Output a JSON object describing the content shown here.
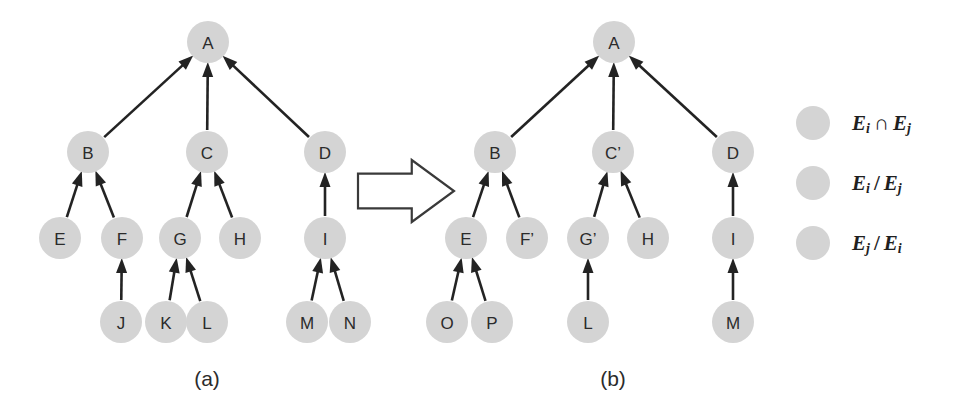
{
  "figure": {
    "background_color": "#ffffff",
    "node_fill_color": "#d4d4d4",
    "edge_color": "#232323",
    "text_color": "#2b2b2b"
  },
  "panels": [
    {
      "key": "a",
      "caption": "(a)",
      "caption_x": 207,
      "caption_y": 378,
      "nodes": [
        {
          "id": "a-A",
          "label": "A",
          "x": 208,
          "y": 42,
          "r": 21
        },
        {
          "id": "a-B",
          "label": "B",
          "x": 88,
          "y": 152,
          "r": 21
        },
        {
          "id": "a-C",
          "label": "C",
          "x": 207,
          "y": 152,
          "r": 21
        },
        {
          "id": "a-D",
          "label": "D",
          "x": 325,
          "y": 152,
          "r": 21
        },
        {
          "id": "a-E",
          "label": "E",
          "x": 60,
          "y": 238,
          "r": 21
        },
        {
          "id": "a-F",
          "label": "F",
          "x": 122,
          "y": 238,
          "r": 21
        },
        {
          "id": "a-G",
          "label": "G",
          "x": 180,
          "y": 238,
          "r": 21
        },
        {
          "id": "a-H",
          "label": "H",
          "x": 240,
          "y": 238,
          "r": 21
        },
        {
          "id": "a-I",
          "label": "I",
          "x": 325,
          "y": 238,
          "r": 21
        },
        {
          "id": "a-J",
          "label": "J",
          "x": 121,
          "y": 322,
          "r": 21
        },
        {
          "id": "a-K",
          "label": "K",
          "x": 166,
          "y": 322,
          "r": 21
        },
        {
          "id": "a-L",
          "label": "L",
          "x": 207,
          "y": 322,
          "r": 21
        },
        {
          "id": "a-M",
          "label": "M",
          "x": 307,
          "y": 322,
          "r": 21
        },
        {
          "id": "a-N",
          "label": "N",
          "x": 350,
          "y": 322,
          "r": 21
        }
      ],
      "edges": [
        {
          "from": "a-B",
          "to": "a-A"
        },
        {
          "from": "a-C",
          "to": "a-A"
        },
        {
          "from": "a-D",
          "to": "a-A"
        },
        {
          "from": "a-E",
          "to": "a-B"
        },
        {
          "from": "a-F",
          "to": "a-B"
        },
        {
          "from": "a-G",
          "to": "a-C"
        },
        {
          "from": "a-H",
          "to": "a-C"
        },
        {
          "from": "a-I",
          "to": "a-D"
        },
        {
          "from": "a-J",
          "to": "a-F"
        },
        {
          "from": "a-K",
          "to": "a-G"
        },
        {
          "from": "a-L",
          "to": "a-G"
        },
        {
          "from": "a-M",
          "to": "a-I"
        },
        {
          "from": "a-N",
          "to": "a-I"
        }
      ]
    },
    {
      "key": "b",
      "caption": "(b)",
      "caption_x": 613,
      "caption_y": 378,
      "nodes": [
        {
          "id": "b-A",
          "label": "A",
          "x": 614,
          "y": 42,
          "r": 21
        },
        {
          "id": "b-B",
          "label": "B",
          "x": 495,
          "y": 152,
          "r": 21
        },
        {
          "id": "b-C",
          "label": "C’",
          "x": 613,
          "y": 152,
          "r": 21
        },
        {
          "id": "b-D",
          "label": "D",
          "x": 733,
          "y": 152,
          "r": 21
        },
        {
          "id": "b-E",
          "label": "E",
          "x": 466,
          "y": 238,
          "r": 21
        },
        {
          "id": "b-F",
          "label": "F’",
          "x": 527,
          "y": 238,
          "r": 21
        },
        {
          "id": "b-G",
          "label": "G’",
          "x": 588,
          "y": 238,
          "r": 21
        },
        {
          "id": "b-H",
          "label": "H",
          "x": 648,
          "y": 238,
          "r": 21
        },
        {
          "id": "b-I",
          "label": "I",
          "x": 733,
          "y": 238,
          "r": 21
        },
        {
          "id": "b-O",
          "label": "O",
          "x": 447,
          "y": 322,
          "r": 21
        },
        {
          "id": "b-P",
          "label": "P",
          "x": 492,
          "y": 322,
          "r": 21
        },
        {
          "id": "b-L",
          "label": "L",
          "x": 588,
          "y": 322,
          "r": 21
        },
        {
          "id": "b-M",
          "label": "M",
          "x": 733,
          "y": 322,
          "r": 21
        }
      ],
      "edges": [
        {
          "from": "b-B",
          "to": "b-A"
        },
        {
          "from": "b-C",
          "to": "b-A"
        },
        {
          "from": "b-D",
          "to": "b-A"
        },
        {
          "from": "b-E",
          "to": "b-B"
        },
        {
          "from": "b-F",
          "to": "b-B"
        },
        {
          "from": "b-G",
          "to": "b-C"
        },
        {
          "from": "b-H",
          "to": "b-C"
        },
        {
          "from": "b-I",
          "to": "b-D"
        },
        {
          "from": "b-O",
          "to": "b-E"
        },
        {
          "from": "b-P",
          "to": "b-E"
        },
        {
          "from": "b-L",
          "to": "b-G"
        },
        {
          "from": "b-M",
          "to": "b-I"
        }
      ]
    }
  ],
  "transform_arrow": {
    "name": "transformation-arrow",
    "x": 358,
    "y": 160,
    "width": 96,
    "height": 62
  },
  "legend": {
    "swatch_x": 813,
    "text_x": 852,
    "swatch_r": 17,
    "items": [
      {
        "key": "intersection",
        "swatch_color": "#d4d4d4",
        "y": 123,
        "base_left": "E",
        "sub_left": "i",
        "operator": "∩",
        "base_right": "E",
        "sub_right": "j",
        "text": "Eᵢ ∩ Eⱼ"
      },
      {
        "key": "i-minus-j",
        "swatch_color": "#d4d4d4",
        "y": 183,
        "base_left": "E",
        "sub_left": "i",
        "operator": "/",
        "base_right": "E",
        "sub_right": "j",
        "text": "Eᵢ / Eⱼ"
      },
      {
        "key": "j-minus-i",
        "swatch_color": "#d4d4d4",
        "y": 243,
        "base_left": "E",
        "sub_left": "j",
        "operator": "/",
        "base_right": "E",
        "sub_right": "i",
        "text": "Eⱼ / Eᵢ"
      }
    ]
  }
}
